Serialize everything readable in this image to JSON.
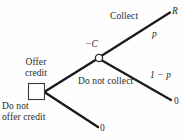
{
  "diagram": {
    "type": "decision-tree",
    "nodes": {
      "decision": {
        "shape": "square",
        "label_above": "Offer\ncredit",
        "label_above_line1": "Offer",
        "label_above_line2": "credit",
        "label_below_line1": "Do not",
        "label_below_line2": "offer credit"
      },
      "chance": {
        "shape": "circle",
        "label_above": "−C"
      }
    },
    "branches": {
      "offer_credit": {
        "label": "Offer credit",
        "cost": "−C"
      },
      "do_not_offer_credit": {
        "label": "Do not offer credit",
        "payoff": "0"
      },
      "collect": {
        "label": "Collect",
        "probability": "p",
        "payoff": "R"
      },
      "do_not_collect": {
        "label": "Do not collect",
        "probability": "1 − p",
        "payoff": "0"
      }
    },
    "payoffs": {
      "collect": "R",
      "do_not_collect": "0",
      "no_offer": "0"
    },
    "colors": {
      "line": "#1a1a1a",
      "text": "#2a2a2a",
      "background": "#fefefe",
      "node_fill": "#ffffff"
    }
  }
}
